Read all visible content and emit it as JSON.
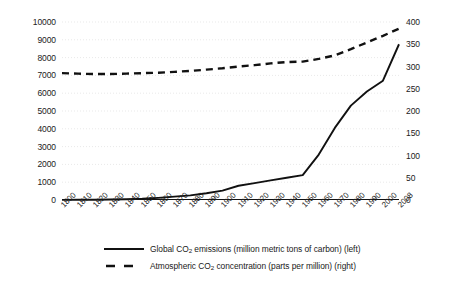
{
  "chart_data": {
    "type": "line",
    "title": "",
    "xlabel": "",
    "ylabel": "",
    "grid": true,
    "legend_position": "bottom",
    "x": [
      1800,
      1810,
      1820,
      1830,
      1840,
      1850,
      1860,
      1870,
      1880,
      1890,
      1900,
      1910,
      1920,
      1930,
      1940,
      1950,
      1960,
      1970,
      1980,
      1990,
      2000,
      2008
    ],
    "xtick_labels": [
      "1800",
      "1810",
      "1820",
      "1830",
      "1840",
      "1850",
      "1860",
      "1870",
      "1880",
      "1890",
      "1900",
      "1910",
      "1920",
      "1930",
      "1940",
      "1950",
      "1960",
      "1970",
      "1980",
      "1990",
      "2000",
      "2008"
    ],
    "axes": {
      "left": {
        "label": "Global CO2 emissions (million metric tons of carbon)",
        "ylim": [
          0,
          10000
        ],
        "tick_step": 1000,
        "tick_labels": [
          "10000",
          "9000",
          "8000",
          "7000",
          "6000",
          "5000",
          "4000",
          "3000",
          "2000",
          "1000",
          "0"
        ],
        "tick_values": [
          10000,
          9000,
          8000,
          7000,
          6000,
          5000,
          4000,
          3000,
          2000,
          1000,
          0
        ]
      },
      "right": {
        "label": "Atmospheric CO2 concentration (parts per million)",
        "ylim": [
          0,
          400
        ],
        "tick_step": 50,
        "tick_labels": [
          "400",
          "350",
          "300",
          "250",
          "200",
          "150",
          "100",
          "50",
          "0"
        ],
        "tick_values": [
          400,
          350,
          300,
          250,
          200,
          150,
          100,
          50,
          0
        ]
      }
    },
    "series": [
      {
        "name": "Global CO2 emissions (million metric tons of carbon) (left)",
        "axis": "left",
        "style": "solid",
        "color": "#111111",
        "values": [
          8,
          12,
          18,
          28,
          45,
          70,
          120,
          190,
          260,
          380,
          530,
          800,
          950,
          1100,
          1250,
          1400,
          2550,
          4050,
          5300,
          6100,
          6700,
          8750
        ]
      },
      {
        "name": "Atmospheric CO2 concentration (parts per million) (right)",
        "axis": "right",
        "style": "dashed",
        "color": "#111111",
        "values": [
          285,
          284,
          283,
          283,
          284,
          285,
          286,
          288,
          290,
          293,
          296,
          300,
          303,
          307,
          310,
          311,
          317,
          325,
          339,
          354,
          369,
          385
        ]
      }
    ]
  },
  "legend": {
    "items": [
      {
        "swatch": "solid-line-swatch",
        "text_before": "Global CO",
        "subscript": "2",
        "text_after": " emissions (million metric tons of carbon) (left)"
      },
      {
        "swatch": "dashed-line-swatch",
        "text_before": "Atmospheric CO",
        "subscript": "2",
        "text_after": " concentration (parts per million) (right)"
      }
    ]
  },
  "colors": {
    "series": "#111111",
    "gridline": "#e9e9e9",
    "axis": "#111111",
    "text": "#1a1a1a",
    "background": "#ffffff"
  }
}
